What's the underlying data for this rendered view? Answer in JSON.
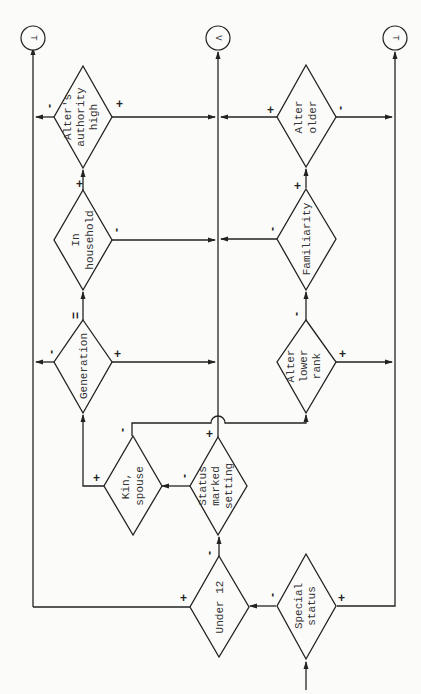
{
  "terminals": {
    "top_left": "T",
    "top_middle": "V",
    "top_right": "T"
  },
  "decisions": {
    "authority": {
      "lines": [
        "Alter's",
        "authority",
        "high"
      ],
      "plus": "+",
      "minus": "-"
    },
    "household": {
      "lines": [
        "In",
        "household"
      ],
      "plus": "+",
      "minus": "-"
    },
    "generation": {
      "lines": [
        "Generation"
      ],
      "plus": "+",
      "minus": "-",
      "equal": "="
    },
    "kin_spouse": {
      "lines": [
        "Kin,",
        "spouse"
      ],
      "plus": "+",
      "minus": "-"
    },
    "status_setting": {
      "lines": [
        "Status",
        "marked",
        "setting"
      ],
      "plus": "+",
      "minus": "-"
    },
    "under12": {
      "lines": [
        "Under 12"
      ],
      "plus": "+",
      "minus": "-"
    },
    "special_status": {
      "lines": [
        "Special",
        "status"
      ],
      "plus": "+",
      "minus": "-"
    },
    "alter_older": {
      "lines": [
        "Alter",
        "older"
      ],
      "plus": "+",
      "minus": "-"
    },
    "familiarity": {
      "lines": [
        "Familiarity"
      ],
      "plus": "+",
      "minus": "-"
    },
    "lower_rank": {
      "lines": [
        "Alter",
        "lower",
        "rank"
      ],
      "plus": "+",
      "minus": "-"
    }
  }
}
